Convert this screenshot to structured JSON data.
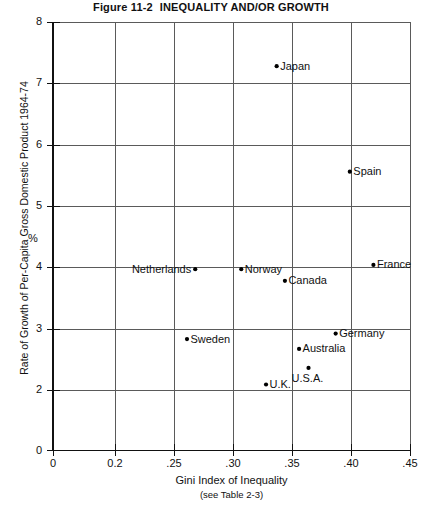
{
  "title": {
    "number": "Figure 11-2",
    "text": "INEQUALITY AND/OR GROWTH"
  },
  "chart_data": {
    "type": "scatter",
    "xlabel": "Gini Index of Inequality",
    "xlabel_note": "(see Table 2-3)",
    "ylabel": "Rate of Growth of Per-Capita  Gross Domestic Product 1964-74",
    "yunit": "%",
    "grid": true,
    "legend": "none",
    "xlim": [
      0,
      0.45
    ],
    "ylim": [
      0,
      8
    ],
    "xticks": [
      0,
      0.2,
      0.25,
      0.3,
      0.35,
      0.4,
      0.45
    ],
    "xticklabels": [
      "0",
      "0.2",
      ".25",
      ".30",
      ".35",
      ".40",
      ".45"
    ],
    "yticks": [
      0,
      2,
      3,
      4,
      5,
      6,
      7,
      8
    ],
    "yticklabels": [
      "0",
      "2",
      "3",
      "4",
      "5",
      "6",
      "7",
      "8"
    ],
    "axis_break_y": "between 0 and 2",
    "axis_break_x": "between 0 and 0.2",
    "points": [
      {
        "name": "Japan",
        "x": 0.337,
        "y": 7.28,
        "label_side": "right"
      },
      {
        "name": "Spain",
        "x": 0.399,
        "y": 5.56,
        "label_side": "right"
      },
      {
        "name": "Netherlands",
        "x": 0.268,
        "y": 3.97,
        "label_side": "left"
      },
      {
        "name": "Norway",
        "x": 0.307,
        "y": 3.97,
        "label_side": "right"
      },
      {
        "name": "France",
        "x": 0.419,
        "y": 4.04,
        "label_side": "right"
      },
      {
        "name": "Canada",
        "x": 0.344,
        "y": 3.78,
        "label_side": "right"
      },
      {
        "name": "Germany",
        "x": 0.387,
        "y": 2.92,
        "label_side": "right"
      },
      {
        "name": "Sweden",
        "x": 0.261,
        "y": 2.83,
        "label_side": "right"
      },
      {
        "name": "Australia",
        "x": 0.356,
        "y": 2.67,
        "label_side": "right"
      },
      {
        "name": "U.S.A.",
        "x": 0.364,
        "y": 2.36,
        "label_side": "below"
      },
      {
        "name": "U.K.",
        "x": 0.328,
        "y": 2.09,
        "label_side": "right"
      }
    ]
  },
  "colors": {
    "ink": "#111111",
    "grid": "#5a5a5a",
    "background": "#ffffff"
  }
}
